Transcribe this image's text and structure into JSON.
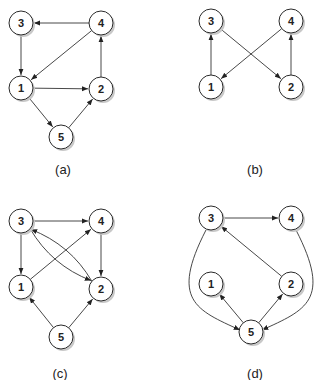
{
  "panels": [
    {
      "id": "a",
      "caption": "(a)",
      "caption_pos": [
        63,
        174
      ],
      "nodes": [
        {
          "id": "3",
          "x": 21,
          "y": 23
        },
        {
          "id": "4",
          "x": 101,
          "y": 23
        },
        {
          "id": "1",
          "x": 21,
          "y": 88
        },
        {
          "id": "2",
          "x": 101,
          "y": 89
        },
        {
          "id": "5",
          "x": 61,
          "y": 137
        }
      ],
      "edges": [
        {
          "from": "4",
          "to": "3"
        },
        {
          "from": "3",
          "to": "1"
        },
        {
          "from": "4",
          "to": "1"
        },
        {
          "from": "1",
          "to": "2"
        },
        {
          "from": "2",
          "to": "4"
        },
        {
          "from": "1",
          "to": "5"
        },
        {
          "from": "5",
          "to": "2"
        }
      ]
    },
    {
      "id": "b",
      "caption": "(b)",
      "caption_pos": [
        255,
        174
      ],
      "nodes": [
        {
          "id": "3",
          "x": 211,
          "y": 21
        },
        {
          "id": "4",
          "x": 291,
          "y": 21
        },
        {
          "id": "1",
          "x": 211,
          "y": 87
        },
        {
          "id": "2",
          "x": 291,
          "y": 87
        }
      ],
      "edges": [
        {
          "from": "1",
          "to": "3"
        },
        {
          "from": "3",
          "to": "2"
        },
        {
          "from": "2",
          "to": "4"
        },
        {
          "from": "4",
          "to": "1"
        }
      ]
    },
    {
      "id": "c",
      "caption": "(c)",
      "caption_pos": [
        60,
        378
      ],
      "nodes": [
        {
          "id": "3",
          "x": 21,
          "y": 221
        },
        {
          "id": "4",
          "x": 101,
          "y": 221
        },
        {
          "id": "1",
          "x": 21,
          "y": 287
        },
        {
          "id": "2",
          "x": 101,
          "y": 289
        },
        {
          "id": "5",
          "x": 61,
          "y": 337
        }
      ],
      "edges": [
        {
          "from": "3",
          "to": "4"
        },
        {
          "from": "3",
          "to": "1"
        },
        {
          "from": "1",
          "to": "4"
        },
        {
          "from": "4",
          "to": "2"
        },
        {
          "from": "3",
          "to": "2",
          "curve": 14
        },
        {
          "from": "2",
          "to": "3",
          "curve": 14
        },
        {
          "from": "5",
          "to": "1"
        },
        {
          "from": "5",
          "to": "2"
        }
      ]
    },
    {
      "id": "d",
      "caption": "(d)",
      "caption_pos": [
        255,
        378
      ],
      "nodes": [
        {
          "id": "3",
          "x": 211,
          "y": 218
        },
        {
          "id": "4",
          "x": 291,
          "y": 218
        },
        {
          "id": "1",
          "x": 211,
          "y": 284
        },
        {
          "id": "2",
          "x": 291,
          "y": 284
        },
        {
          "id": "5",
          "x": 251,
          "y": 332
        }
      ],
      "edges": [
        {
          "from": "3",
          "to": "4"
        },
        {
          "from": "2",
          "to": "3"
        },
        {
          "from": "3",
          "to": "5",
          "path": "M 206 230 C 170 300, 196 310, 240 330"
        },
        {
          "from": "4",
          "to": "5",
          "path": "M 296 230 C 332 300, 306 310, 262 330"
        },
        {
          "from": "5",
          "to": "1"
        },
        {
          "from": "5",
          "to": "2"
        }
      ]
    }
  ],
  "style": {
    "node_radius": 12,
    "stroke": "#333333",
    "node_fill": "#ffffff",
    "shadow": "#c8c8c8"
  }
}
